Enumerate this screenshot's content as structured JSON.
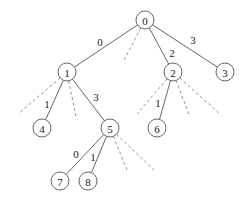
{
  "diagram": {
    "type": "tree",
    "nodes": [
      {
        "id": "0",
        "label": "0",
        "x": 145,
        "y": 20
      },
      {
        "id": "1",
        "label": "1",
        "x": 67,
        "y": 72
      },
      {
        "id": "2",
        "label": "2",
        "x": 173,
        "y": 72
      },
      {
        "id": "3",
        "label": "3",
        "x": 225,
        "y": 72
      },
      {
        "id": "4",
        "label": "4",
        "x": 42,
        "y": 128
      },
      {
        "id": "5",
        "label": "5",
        "x": 110,
        "y": 128
      },
      {
        "id": "6",
        "label": "6",
        "x": 157,
        "y": 128
      },
      {
        "id": "7",
        "label": "7",
        "x": 60,
        "y": 181
      },
      {
        "id": "8",
        "label": "8",
        "x": 88,
        "y": 181
      }
    ],
    "edges": [
      {
        "from": "0",
        "to": "1",
        "label": "0",
        "lx": 100,
        "ly": 42
      },
      {
        "from": "0",
        "to": "2",
        "label": "2",
        "lx": 172,
        "ly": 53
      },
      {
        "from": "0",
        "to": "3",
        "label": "3",
        "lx": 193,
        "ly": 40
      },
      {
        "from": "1",
        "to": "4",
        "label": "1",
        "lx": 47,
        "ly": 104
      },
      {
        "from": "1",
        "to": "5",
        "label": "3",
        "lx": 96,
        "ly": 97
      },
      {
        "from": "2",
        "to": "6",
        "label": "1",
        "lx": 158,
        "ly": 103
      },
      {
        "from": "5",
        "to": "7",
        "label": "0",
        "lx": 76,
        "ly": 154
      },
      {
        "from": "5",
        "to": "8",
        "label": "1",
        "lx": 93,
        "ly": 157
      }
    ],
    "dashed_edges": [
      {
        "from": "0",
        "x2": 123,
        "y2": 62
      },
      {
        "from": "1",
        "x2": 18,
        "y2": 114
      },
      {
        "from": "1",
        "x2": 76,
        "y2": 117
      },
      {
        "from": "2",
        "x2": 137,
        "y2": 114
      },
      {
        "from": "2",
        "x2": 190,
        "y2": 117
      },
      {
        "from": "2",
        "x2": 220,
        "y2": 114
      },
      {
        "from": "5",
        "x2": 127,
        "y2": 170
      },
      {
        "from": "5",
        "x2": 154,
        "y2": 170
      }
    ]
  }
}
